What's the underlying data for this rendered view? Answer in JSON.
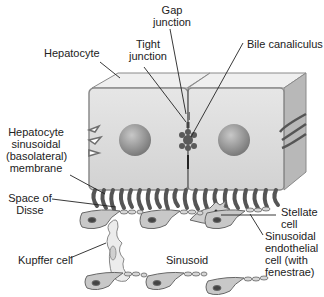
{
  "diagram": {
    "labels": {
      "gap_junction": [
        "Gap",
        "junction"
      ],
      "tight_junction": [
        "Tight",
        "junction"
      ],
      "hepatocyte": "Hepatocyte",
      "bile_canaliculus": "Bile canaliculus",
      "basolateral_membrane": [
        "Hepatocyte",
        "sinusoidal",
        "(basolateral)",
        "membrane"
      ],
      "space_of_disse": [
        "Space of",
        "Disse"
      ],
      "stellate_cell": [
        "Stellate",
        "cell"
      ],
      "sinusoidal_endothelial_cell": [
        "Sinusoidal",
        "endothelial",
        "cell (with",
        "fenestrae)"
      ],
      "kupffer_cell": "Kupffer cell",
      "sinusoid": "Sinusoid"
    },
    "colors": {
      "cell_face": "#d9d9d9",
      "cell_top": "#ececec",
      "cell_side": "#b5b5b5",
      "nucleus": "#8c8c8c",
      "outline": "#6e6e6e",
      "junction": "#555555",
      "leader_line": "#222222"
    }
  }
}
